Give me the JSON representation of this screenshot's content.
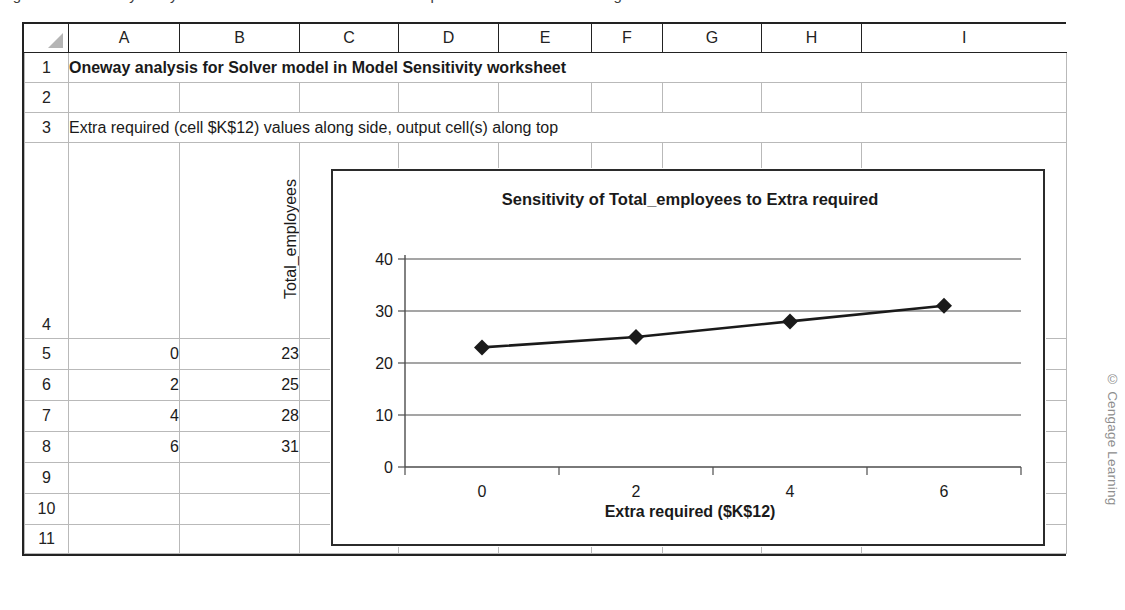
{
  "top_caption": {
    "text": "Figure 4.30   Oneway analysis for Solver model with the Extra required cell varied over a range"
  },
  "spreadsheet": {
    "corner_icon": "select-all-triangle-icon",
    "columns": [
      "A",
      "B",
      "C",
      "D",
      "E",
      "F",
      "G",
      "H",
      "I"
    ],
    "rows": [
      "1",
      "2",
      "3",
      "4",
      "5",
      "6",
      "7",
      "8",
      "9",
      "10",
      "11"
    ],
    "cells": {
      "A1": "Oneway analysis for Solver model in Model Sensitivity worksheet",
      "A3": "Extra required (cell $K$12) values along side, output cell(s) along top",
      "B4": "Total_employees",
      "A5": "0",
      "A6": "2",
      "A7": "4",
      "A8": "6",
      "B5": "23",
      "B6": "25",
      "B7": "28",
      "B8": "31"
    }
  },
  "chart_data": {
    "type": "line",
    "title": "Sensitivity of Total_employees to Extra required",
    "xlabel": "Extra required ($K$12)",
    "ylabel": "",
    "x": [
      0,
      2,
      4,
      6
    ],
    "values": [
      23,
      25,
      28,
      31
    ],
    "series": [
      {
        "name": "Total_employees",
        "values": [
          23,
          25,
          28,
          31
        ]
      }
    ],
    "xticks": [
      "0",
      "2",
      "4",
      "6"
    ],
    "yticks": [
      "0",
      "10",
      "20",
      "30",
      "40"
    ],
    "ylim": [
      0,
      40
    ],
    "grid": "horizontal",
    "legend": "none",
    "marker": "diamond",
    "line_color": "#1a1a1a",
    "marker_color": "#1a1a1a"
  },
  "credit": {
    "text": "© Cengage Learning"
  }
}
